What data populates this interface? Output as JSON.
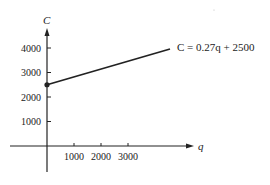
{
  "chart_data": {
    "type": "line",
    "title": "",
    "xlabel": "q",
    "ylabel": "C",
    "x_ticks": [
      1000,
      2000,
      3000
    ],
    "y_ticks": [
      1000,
      2000,
      3000,
      4000
    ],
    "x_tick_labels": [
      "1000",
      "2000",
      "3000"
    ],
    "y_tick_labels": [
      "1000",
      "2000",
      "3000",
      "4000"
    ],
    "xlim": [
      -1100,
      5500
    ],
    "ylim": [
      -1500,
      5000
    ],
    "grid": false,
    "series": [
      {
        "name": "C = 0.27q + 2500",
        "equation": "C = 0.27q + 2500",
        "slope": 0.27,
        "intercept": 2500,
        "x": [
          0,
          4550
        ],
        "y": [
          2500,
          3730
        ]
      }
    ],
    "annotations": [
      {
        "text": "C = 0.27q + 2500",
        "position": "line end, right"
      },
      {
        "text": "filled dot",
        "at": [
          0,
          2500
        ]
      }
    ],
    "legend": "none"
  },
  "labels": {
    "y_axis": "C",
    "x_axis": "q",
    "equation": "C = 0.27q + 2500"
  }
}
